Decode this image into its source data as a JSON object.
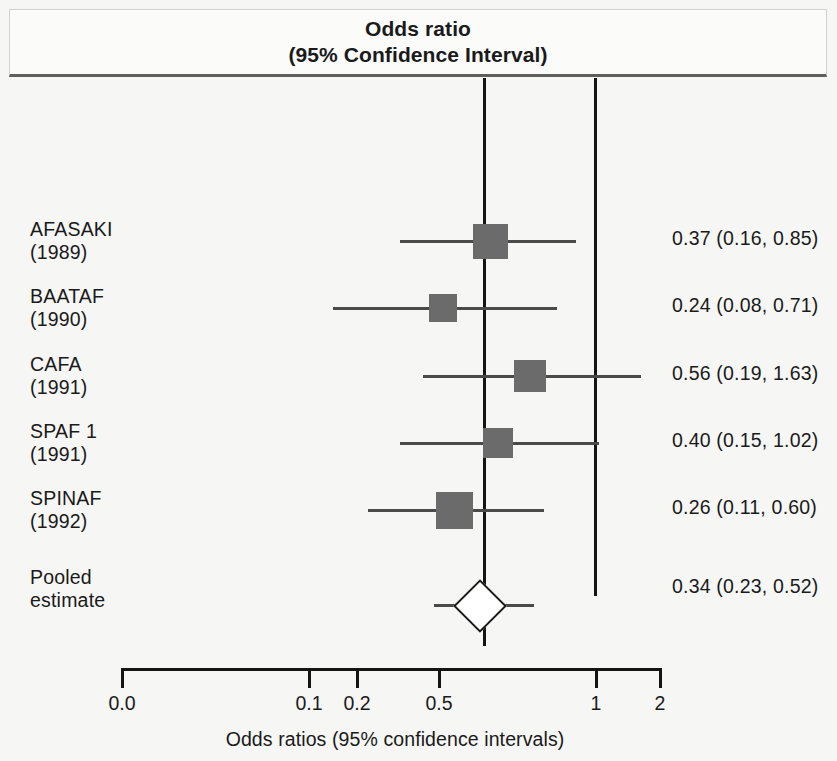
{
  "header": {
    "line1": "Odds ratio",
    "line2": "(95% Confidence Interval)"
  },
  "axis": {
    "title": "Odds ratios (95% confidence intervals)",
    "ticks": [
      {
        "label": "0.0",
        "x": 121
      },
      {
        "label": "0.1",
        "x": 308
      },
      {
        "label": "0.2",
        "x": 356
      },
      {
        "label": "0.5",
        "x": 438
      },
      {
        "label": "1",
        "x": 595
      },
      {
        "label": "2",
        "x": 659
      }
    ]
  },
  "reference_lines": [
    {
      "name": "pooled-estimate-line",
      "x": 483
    },
    {
      "name": "null-effect-line",
      "x": 594
    }
  ],
  "rows": [
    {
      "study": "AFASAKI",
      "year": "(1989)",
      "label": "AFASAKI\n(1989)",
      "value_text": "0.37 (0.16, 0.85)",
      "top": 140,
      "marker": {
        "type": "box",
        "left": 473,
        "width": 35,
        "height": 35,
        "top": 6
      },
      "ci": {
        "left": 400,
        "right": 576,
        "y": 22
      }
    },
    {
      "study": "BAATAF",
      "year": "(1990)",
      "label": "BAATAF\n(1990)",
      "value_text": "0.24 (0.08, 0.71)",
      "top": 207,
      "marker": {
        "type": "box",
        "left": 429,
        "width": 28,
        "height": 28,
        "top": 9
      },
      "ci": {
        "left": 333,
        "right": 557,
        "y": 22
      }
    },
    {
      "study": "CAFA",
      "year": "(1991)",
      "label": "CAFA\n(1991)",
      "value_text": "0.56 (0.19, 1.63)",
      "top": 275,
      "marker": {
        "type": "box",
        "left": 514,
        "width": 32,
        "height": 32,
        "top": 7
      },
      "ci": {
        "left": 423,
        "right": 641,
        "y": 22
      }
    },
    {
      "study": "SPAF 1",
      "year": "(1991)",
      "label": "SPAF 1\n(1991)",
      "value_text": "0.40 (0.15, 1.02)",
      "top": 342,
      "marker": {
        "type": "box",
        "left": 483,
        "width": 30,
        "height": 30,
        "top": 8
      },
      "ci": {
        "left": 400,
        "right": 599,
        "y": 22
      }
    },
    {
      "study": "SPINAF",
      "year": "(1992)",
      "label": "SPINAF\n(1992)",
      "value_text": "0.26 (0.11, 0.60)",
      "top": 409,
      "marker": {
        "type": "box",
        "left": 436,
        "width": 37,
        "height": 37,
        "top": 5
      },
      "ci": {
        "left": 368,
        "right": 544,
        "y": 22
      }
    },
    {
      "study": "Pooled estimate",
      "year": "",
      "label": "Pooled\nestimate",
      "value_text": "0.34 (0.23, 0.52)",
      "top": 488,
      "marker": {
        "type": "diamond",
        "left": 461,
        "width": 34,
        "height": 34,
        "top": 21
      },
      "ci": {
        "left": 434,
        "right": 534,
        "y": 38
      }
    }
  ],
  "chart_data": {
    "type": "forest",
    "title": "Odds ratio (95% Confidence Interval)",
    "xlabel": "Odds ratios (95% confidence intervals)",
    "ylabel": "",
    "xscale": "log",
    "xticks": [
      0.0,
      0.1,
      0.2,
      0.5,
      1,
      2
    ],
    "xtick_labels": [
      "0.0",
      "0.1",
      "0.2",
      "0.5",
      "1",
      "2"
    ],
    "null_line": 1,
    "pooled_line": 0.34,
    "grid": false,
    "legend": "none",
    "categories": [
      "AFASAKI (1989)",
      "BAATAF (1990)",
      "CAFA (1991)",
      "SPAF 1 (1991)",
      "SPINAF (1992)",
      "Pooled estimate"
    ],
    "values": [
      0.37,
      0.24,
      0.56,
      0.4,
      0.26,
      0.34
    ],
    "ci_lower": [
      0.16,
      0.08,
      0.19,
      0.15,
      0.11,
      0.23
    ],
    "ci_upper": [
      0.85,
      0.71,
      1.63,
      1.02,
      0.6,
      0.52
    ],
    "labels": [
      "0.37 (0.16, 0.85)",
      "0.24 (0.08, 0.71)",
      "0.56 (0.19, 1.63)",
      "0.40 (0.15, 1.02)",
      "0.26 (0.11, 0.60)",
      "0.34 (0.23, 0.52)"
    ]
  },
  "colors": {
    "marker_fill": "#6b6b6b",
    "line": "#141414",
    "ci_line": "#4a4a4a",
    "background": "#f6f6f4",
    "diamond_fill": "#ffffff"
  }
}
